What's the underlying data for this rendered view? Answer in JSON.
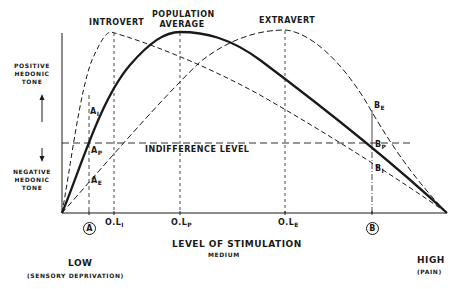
{
  "curves": {
    "introvert": {
      "label": "INTROVERT",
      "style": "dashed"
    },
    "population": {
      "label_line1": "POPULATION",
      "label_line2": "AVERAGE",
      "style": "solid-thick"
    },
    "extravert": {
      "label": "EXTRAVERT",
      "style": "dashed"
    }
  },
  "y_axis": {
    "positive": {
      "line1": "POSITIVE",
      "line2": "HEDONIC",
      "line3": "TONE"
    },
    "negative": {
      "line1": "NEGATIVE",
      "line2": "HEDONIC",
      "line3": "TONE"
    }
  },
  "indifference": {
    "label": "INDIFFERENCE LEVEL"
  },
  "points": {
    "A_I": {
      "main": "A",
      "sub": "I"
    },
    "A_P": {
      "main": "A",
      "sub": "P"
    },
    "A_E": {
      "main": "A",
      "sub": "E"
    },
    "B_E": {
      "main": "B",
      "sub": "E"
    },
    "B_P": {
      "main": "B",
      "sub": "P"
    },
    "B_I": {
      "main": "B",
      "sub": "I"
    }
  },
  "x_ticks": {
    "A": "A",
    "OL_I": {
      "main": "O.L",
      "sub": "I"
    },
    "OL_P": {
      "main": "O.L",
      "sub": "P"
    },
    "OL_E": {
      "main": "O.L",
      "sub": "E"
    },
    "B": "B"
  },
  "x_axis": {
    "title": "LEVEL OF STIMULATION",
    "medium": "MEDIUM",
    "low": "LOW",
    "low_note": "(SENSORY DEPRIVATION)",
    "high": "HIGH",
    "high_note": "(PAIN)"
  }
}
